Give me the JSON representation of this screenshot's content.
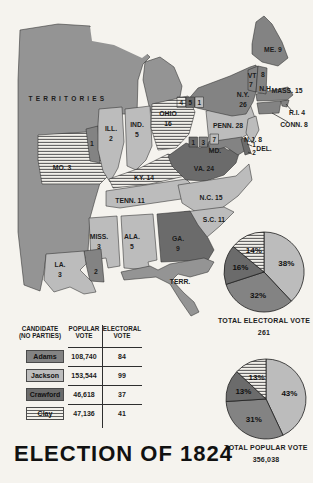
{
  "colors": {
    "page_bg": "#f5f3ee",
    "ink": "#1c1c1c",
    "adams": "#838383",
    "jackson": "#bcbcbc",
    "crawford": "#6b6b6b",
    "clay_bg": "#f2f0ea",
    "clay_stripe": "#5f5f5f",
    "territory": "#949494"
  },
  "title": "ELECTION OF 1824",
  "map": {
    "territories_label": "TERRITORIES",
    "labels": {
      "mo": {
        "t1": "MO. 3"
      },
      "ill": {
        "t1": "ILL.",
        "t2": "2"
      },
      "ill_split": {
        "t1": "1"
      },
      "ind": {
        "t1": "IND.",
        "t2": "5"
      },
      "ohio": {
        "t1": "OHIO",
        "t2": "16"
      },
      "ky": {
        "t1": "KY. 14"
      },
      "tenn": {
        "t1": "TENN. 11"
      },
      "va": {
        "t1": "VA. 24"
      },
      "nc": {
        "t1": "N.C. 15"
      },
      "sc": {
        "t1": "S.C. 11"
      },
      "ga": {
        "t1": "GA.",
        "t2": "9"
      },
      "ala": {
        "t1": "ALA.",
        "t2": "5"
      },
      "miss": {
        "t1": "MISS.",
        "t2": "3"
      },
      "la": {
        "t1": "LA.",
        "t2": "3"
      },
      "la_split": {
        "t1": "2"
      },
      "fla": {
        "t1": "TERR."
      },
      "ny": {
        "t1": "N.Y.",
        "t2": "26"
      },
      "penn": {
        "t1": "PENN. 28"
      },
      "nj": {
        "t1": "N.J. 8"
      },
      "me": {
        "t1": "ME. 9"
      },
      "vt": {
        "t1": "VT",
        "t2": "7"
      },
      "nh": {
        "t1": "8",
        "t2": "N.H"
      },
      "mass": {
        "t1": "MASS. 15"
      },
      "ri": {
        "t1": "R.I. 4"
      },
      "conn": {
        "t1": "CONN. 8"
      },
      "md": {
        "t1": "MD."
      },
      "del": {
        "t1": "DEL."
      }
    },
    "vote_splits": {
      "ny": [
        "4",
        "5",
        "1"
      ],
      "md": [
        "1",
        "3",
        "7"
      ],
      "del": [
        "1",
        "2"
      ]
    }
  },
  "table": {
    "headers": {
      "c1a": "CANDIDATE",
      "c1b": "(NO PARTIES)",
      "c2a": "POPULAR",
      "c2b": "VOTE",
      "c3a": "ELECTORAL",
      "c3b": "VOTE"
    },
    "rows": [
      {
        "candidate": "Adams",
        "popular": "108,740",
        "electoral": "84",
        "fill": "adams"
      },
      {
        "candidate": "Jackson",
        "popular": "153,544",
        "electoral": "99",
        "fill": "jackson"
      },
      {
        "candidate": "Crawford",
        "popular": "46,618",
        "electoral": "37",
        "fill": "crawford"
      },
      {
        "candidate": "Clay",
        "popular": "47,136",
        "electoral": "41",
        "fill": "clay"
      }
    ]
  },
  "chart_data": [
    {
      "type": "pie",
      "title": "TOTAL ELECTORAL VOTE",
      "total": "261",
      "legend_position": "none",
      "slices": [
        {
          "candidate": "Jackson",
          "label": "38%",
          "value": 38,
          "fill": "jackson"
        },
        {
          "candidate": "Adams",
          "label": "32%",
          "value": 32,
          "fill": "adams"
        },
        {
          "candidate": "Crawford",
          "label": "16%",
          "value": 16,
          "fill": "crawford"
        },
        {
          "candidate": "Clay",
          "label": "14%",
          "value": 14,
          "fill": "clay"
        }
      ]
    },
    {
      "type": "pie",
      "title": "TOTAL POPULAR VOTE",
      "total": "356,038",
      "legend_position": "none",
      "slices": [
        {
          "candidate": "Jackson",
          "label": "43%",
          "value": 43,
          "fill": "jackson"
        },
        {
          "candidate": "Adams",
          "label": "31%",
          "value": 31,
          "fill": "adams"
        },
        {
          "candidate": "Crawford",
          "label": "13%",
          "value": 13,
          "fill": "crawford"
        },
        {
          "candidate": "Clay",
          "label": "13%",
          "value": 13,
          "fill": "clay"
        }
      ]
    }
  ]
}
